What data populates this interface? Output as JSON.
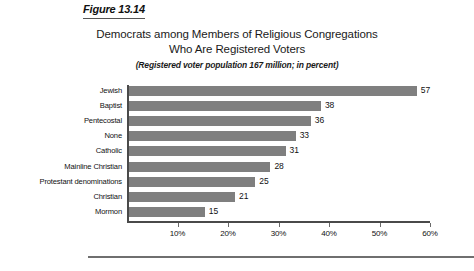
{
  "figure": {
    "caption": "Figure 13.14"
  },
  "chart_data": {
    "type": "bar",
    "orientation": "horizontal",
    "title": "Democrats among Members of Religious Congregations Who Are Registered Voters",
    "title_line1": "Democrats among Members of Religious Congregations",
    "title_line2": "Who Are Registered Voters",
    "subtitle": "(Registered voter population 167 million; in percent)",
    "categories": [
      "Jewish",
      "Baptist",
      "Pentecostal",
      "None",
      "Catholic",
      "Mainline Christian",
      "Protestant denominations",
      "Christian",
      "Mormon"
    ],
    "values": [
      57,
      38,
      36,
      33,
      31,
      28,
      25,
      21,
      15
    ],
    "value_labels": [
      "57",
      "38",
      "36",
      "33",
      "31",
      "28",
      "25",
      "21",
      "15"
    ],
    "xlabel": "",
    "ylabel": "",
    "xlim": [
      0,
      60
    ],
    "xticks": [
      10,
      20,
      30,
      40,
      50,
      60
    ],
    "xtick_labels": [
      "10%",
      "20%",
      "30%",
      "40%",
      "50%",
      "60%"
    ],
    "grid": true,
    "grid_axis": "x",
    "grid_color": "#ffffff",
    "legend": false,
    "bar_color": "#7f7f7f",
    "axis_color": "#4a4a4a",
    "background": "#ffffff"
  }
}
